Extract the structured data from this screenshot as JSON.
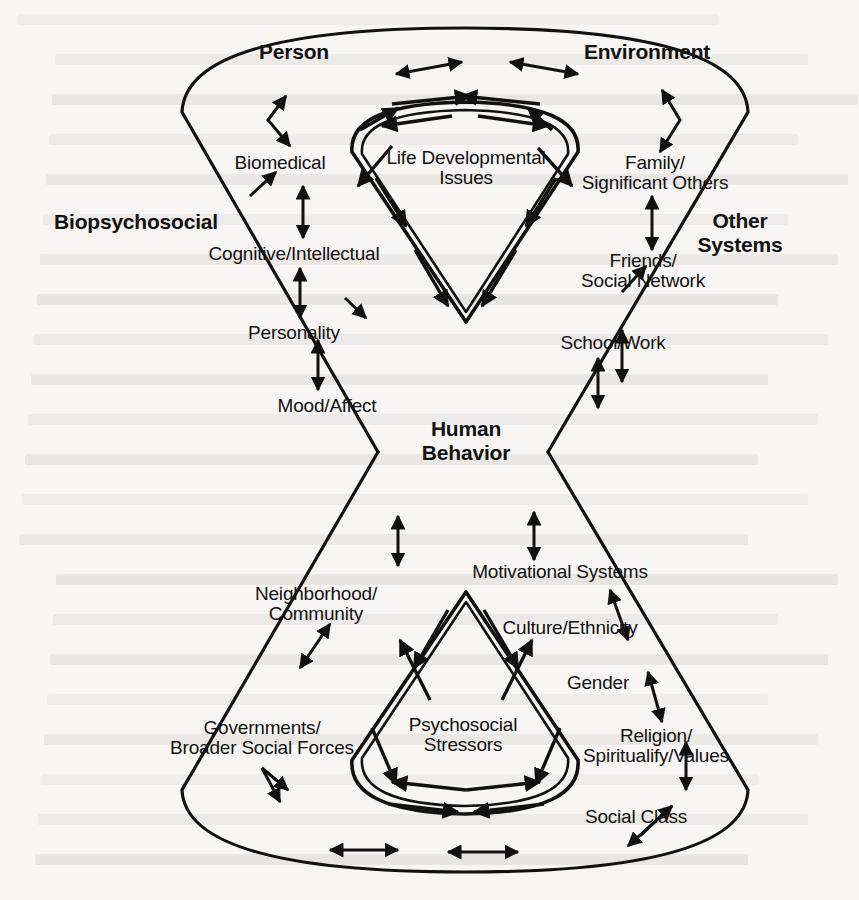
{
  "figure": {
    "type": "diagram",
    "kind": "hourglass-bowtie-nested-cones",
    "ink_color": "#111111",
    "paper_color": "#f7f6f4"
  },
  "headings": {
    "person": "Person",
    "environment": "Environment",
    "biopsychosocial": "Biopsychosocial",
    "other_systems": "Other\nSystems",
    "human_behavior": "Human\nBehavior"
  },
  "inner_labels": {
    "top": "Life Developmental\nIssues",
    "bottom": "Psychosocial\nStressors"
  },
  "person_domain": [
    {
      "label": "Biomedical"
    },
    {
      "label": "Cognitive/Intellectual"
    },
    {
      "label": "Personality"
    },
    {
      "label": "Mood/Affect"
    }
  ],
  "environment_domain": [
    {
      "label": "Family/\nSignificant Others"
    },
    {
      "label": "Friends/\nSocial Network"
    },
    {
      "label": "School/Work"
    }
  ],
  "biopsychosocial_domain": [
    {
      "label": "Neighborhood/\nCommunity"
    },
    {
      "label": "Governments/\nBroader Social Forces"
    }
  ],
  "other_systems_domain": [
    {
      "label": "Motivational Systems"
    },
    {
      "label": "Culture/Ethnicity"
    },
    {
      "label": "Gender"
    },
    {
      "label": "Religion/\nSpiritualify/Values"
    },
    {
      "label": "Social Class"
    }
  ],
  "background_text_lines": 22
}
